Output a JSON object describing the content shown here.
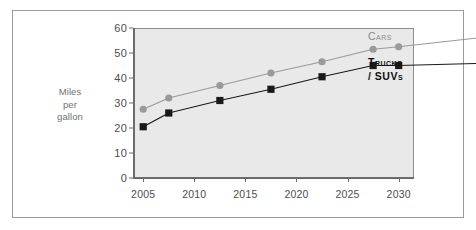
{
  "chart_data": {
    "type": "line",
    "title": "",
    "xlabel": "",
    "ylabel": "Miles per gallon",
    "ylabel_lines": [
      "Miles",
      "per",
      "gallon"
    ],
    "x": [
      2005,
      2007.5,
      2012.5,
      2017.5,
      2022.5,
      2027.5,
      2030
    ],
    "xlim": [
      2004,
      2031.5
    ],
    "ylim": [
      0,
      60
    ],
    "xticks": [
      2005,
      2010,
      2015,
      2020,
      2025,
      2030
    ],
    "xtick_labels": [
      "2005",
      "2010",
      "2015",
      "2020",
      "2025",
      "2030"
    ],
    "yticks": [
      0,
      10,
      20,
      30,
      40,
      50,
      60
    ],
    "ytick_labels": [
      "0",
      "10",
      "20",
      "30",
      "40",
      "50",
      "60"
    ],
    "grid": false,
    "legend_position": "right",
    "series": [
      {
        "name": "Cars",
        "name_lines": [
          "Cars"
        ],
        "color": "#9a9a9a",
        "marker": "circle",
        "values": [
          27.5,
          32,
          37,
          42,
          46.5,
          51.5,
          52.5
        ]
      },
      {
        "name": "Trucks / SUVs",
        "name_lines": [
          "Trucks",
          "/ SUVs"
        ],
        "color": "#1a1a1a",
        "marker": "square",
        "values": [
          20.5,
          26,
          31,
          35.5,
          40.5,
          45,
          45
        ]
      }
    ]
  },
  "figure": {
    "background_color": "#ffffff",
    "plot_background_color": "#e9e9e9",
    "frame_color": "#9a9a9a",
    "axis_color": "#6b6b6b",
    "tick_label_color": "#4d4d4d",
    "axis_title_color": "#6f6f6f"
  }
}
